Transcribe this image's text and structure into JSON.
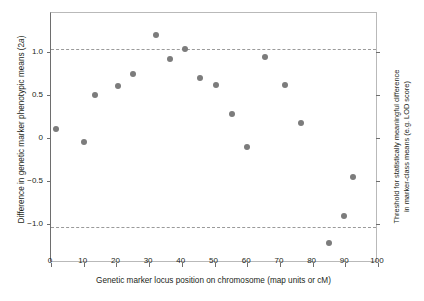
{
  "chart_data": {
    "type": "scatter",
    "title": "",
    "xlabel": "Genetic marker locus position on chromosome (map units or cM)",
    "ylabel": "Difference in genetic marker phenotypic means (2a)",
    "ylabel_prefix": "Difference in genetic marker phenotypic means (2",
    "ylabel_italic": "a",
    "ylabel_suffix": ")",
    "right_label_line1": "Threshold for statistically meaningful difference",
    "right_label_line2": "in marker-class means (e.g. LOD score)",
    "xlim": [
      0,
      100
    ],
    "ylim": [
      -1.45,
      1.45
    ],
    "grid": false,
    "legend": false,
    "xticks": [
      0,
      10,
      20,
      30,
      40,
      50,
      60,
      70,
      80,
      90,
      100
    ],
    "xtick_labels": [
      "0",
      "10",
      "20",
      "30",
      "40",
      "50",
      "60",
      "70",
      "80",
      "90",
      "100"
    ],
    "yticks": [
      1.0,
      0.5,
      0,
      -0.5,
      -1.0
    ],
    "ytick_labels": [
      "1.0",
      "0.5",
      "0",
      "−0.5",
      "−1.0"
    ],
    "marker_color": "#7c7c7c",
    "threshold_color": "#9a9a9a",
    "thresholds": [
      1.03,
      -1.03
    ],
    "x": [
      1.5,
      10,
      13.5,
      20.5,
      25,
      32,
      36.5,
      41,
      45.5,
      50.5,
      55.5,
      60,
      65.5,
      71.5,
      76.5,
      85,
      89.5,
      92.5
    ],
    "y": [
      0.1,
      -0.05,
      0.5,
      0.6,
      0.74,
      1.19,
      0.92,
      1.03,
      0.7,
      0.61,
      0.28,
      -0.11,
      0.94,
      0.61,
      0.17,
      -1.22,
      -0.9,
      -0.45
    ],
    "points": [
      {
        "x": 1.5,
        "y": 0.1
      },
      {
        "x": 10,
        "y": -0.05
      },
      {
        "x": 13.5,
        "y": 0.5
      },
      {
        "x": 20.5,
        "y": 0.6
      },
      {
        "x": 25,
        "y": 0.74
      },
      {
        "x": 32,
        "y": 1.19
      },
      {
        "x": 36.5,
        "y": 0.92
      },
      {
        "x": 41,
        "y": 1.03
      },
      {
        "x": 45.5,
        "y": 0.7
      },
      {
        "x": 50.5,
        "y": 0.61
      },
      {
        "x": 55.5,
        "y": 0.28
      },
      {
        "x": 60,
        "y": -0.11
      },
      {
        "x": 65.5,
        "y": 0.94
      },
      {
        "x": 71.5,
        "y": 0.61
      },
      {
        "x": 76.5,
        "y": 0.17
      },
      {
        "x": 85,
        "y": -1.22
      },
      {
        "x": 89.5,
        "y": -0.9
      },
      {
        "x": 92.5,
        "y": -0.45
      }
    ]
  }
}
